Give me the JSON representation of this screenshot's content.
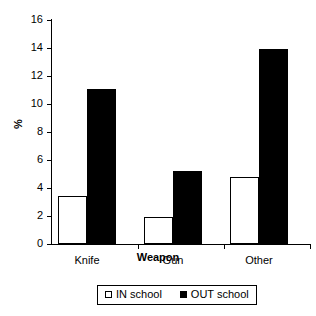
{
  "chart_data": {
    "type": "bar",
    "title": "",
    "xlabel": "Weapon",
    "ylabel": "%",
    "categories": [
      "Knife",
      "Gun",
      "Other"
    ],
    "series": [
      {
        "name": "IN school",
        "values": [
          3.4,
          1.9,
          4.8
        ],
        "color": "#ffffff"
      },
      {
        "name": "OUT school",
        "values": [
          11.1,
          5.2,
          13.9
        ],
        "color": "#000000"
      }
    ],
    "ylim": [
      0,
      16
    ],
    "yticks": [
      0,
      2,
      4,
      6,
      8,
      10,
      12,
      14,
      16
    ],
    "ytick_labels": [
      "0",
      "2",
      "4",
      "6",
      "8",
      "10",
      "12",
      "14",
      "16"
    ],
    "grid": false,
    "legend_position": "bottom"
  },
  "axes": {
    "y_title": "%",
    "x_title": "Weapon"
  },
  "legend": {
    "entries": [
      {
        "label": "IN school",
        "swatch": "hollow-square-icon"
      },
      {
        "label": "OUT school",
        "swatch": "filled-square-icon"
      }
    ]
  }
}
